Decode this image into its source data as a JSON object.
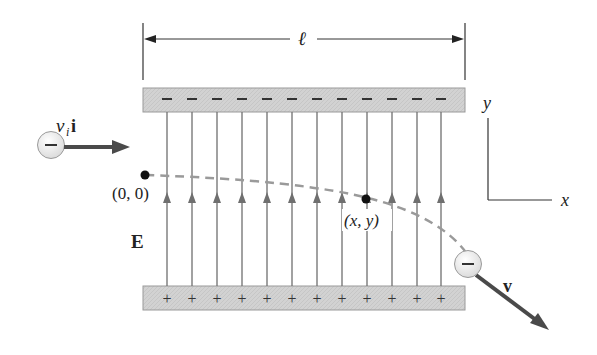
{
  "figure": {
    "length_label": "ℓ",
    "initial_velocity_label": {
      "main": "v",
      "sub": "i",
      "vec": "i"
    },
    "origin_label": "(0, 0)",
    "point_label": "(x, y)",
    "field_label": "E",
    "final_velocity_label": "v",
    "axis_x_label": "x",
    "axis_y_label": "y",
    "electron_charge_symbol": "−",
    "top_plate_charge": "−",
    "bottom_plate_charge": "+",
    "field_line_count": 12,
    "field_line_x": [
      167,
      192,
      217,
      242,
      267,
      292,
      317,
      342,
      367,
      392,
      417,
      441
    ],
    "colors": {
      "plate_fill": "#cfcfcf",
      "plate_border": "#9a9a9a",
      "field_line": "#6f6f6f",
      "trajectory": "#9a9a9a",
      "vector": "#4a4a4a",
      "electron_fill": "#ececec",
      "text": "#222222"
    }
  }
}
